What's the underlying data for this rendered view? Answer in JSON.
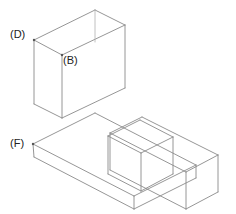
{
  "figure": {
    "background_color": "#ffffff",
    "line_color": "#8a8a8a",
    "label_color": "#222222",
    "width": 236,
    "height": 214,
    "projection": "isometric"
  },
  "labels": [
    {
      "id": "D",
      "text": "(D)",
      "x": 10,
      "y": 28,
      "vertex_x": 34,
      "vertex_y": 40
    },
    {
      "id": "B",
      "text": "(B)",
      "x": 63,
      "y": 54,
      "vertex_x": 62,
      "vertex_y": 55
    },
    {
      "id": "F",
      "text": "(F)",
      "x": 10,
      "y": 137,
      "vertex_x": 33,
      "vertex_y": 144
    }
  ],
  "geometry": {
    "upright_block": {
      "name": "vertical-upright",
      "top_face": [
        [
          34,
          40
        ],
        [
          95,
          10
        ],
        [
          125,
          25
        ],
        [
          62,
          55
        ]
      ],
      "left_face": [
        [
          34,
          40
        ],
        [
          62,
          55
        ],
        [
          62,
          117
        ],
        [
          34,
          103
        ]
      ],
      "front_face": [
        [
          62,
          55
        ],
        [
          125,
          25
        ],
        [
          125,
          88
        ],
        [
          62,
          117
        ]
      ]
    },
    "base_slab": {
      "name": "horizontal-base-plate",
      "top_face": [
        [
          33,
          144
        ],
        [
          95,
          113
        ],
        [
          196,
          165
        ],
        [
          134,
          196
        ]
      ],
      "front_left_face": [
        [
          33,
          144
        ],
        [
          34,
          156
        ],
        [
          134,
          208
        ],
        [
          134,
          196
        ]
      ],
      "right_face": [
        [
          134,
          196
        ],
        [
          196,
          165
        ],
        [
          196,
          177
        ],
        [
          134,
          208
        ]
      ]
    },
    "right_arm": {
      "name": "right-horizontal-arm",
      "top_face": [
        [
          110,
          133
        ],
        [
          142,
          117
        ],
        [
          218,
          155
        ],
        [
          186,
          172
        ]
      ],
      "front_face": [
        [
          110,
          133
        ],
        [
          110,
          170
        ],
        [
          186,
          208
        ],
        [
          186,
          172
        ]
      ],
      "end_face": [
        [
          186,
          172
        ],
        [
          218,
          155
        ],
        [
          218,
          192
        ],
        [
          186,
          208
        ]
      ]
    },
    "inner_box": {
      "name": "nested-inner-box",
      "top_face": [
        [
          108,
          135
        ],
        [
          140,
          119
        ],
        [
          173,
          136
        ],
        [
          141,
          152
        ]
      ],
      "front_face": [
        [
          108,
          135
        ],
        [
          108,
          173
        ],
        [
          141,
          190
        ],
        [
          141,
          152
        ]
      ],
      "right_face": [
        [
          141,
          152
        ],
        [
          173,
          136
        ],
        [
          173,
          173
        ],
        [
          141,
          190
        ]
      ]
    }
  },
  "edges": [
    {
      "name": "upright-top-rear-left",
      "from": [
        34,
        40
      ],
      "to": [
        95,
        10
      ],
      "weight": "normal"
    },
    {
      "name": "upright-top-rear-right",
      "from": [
        95,
        10
      ],
      "to": [
        125,
        25
      ],
      "weight": "normal"
    },
    {
      "name": "upright-top-front-right",
      "from": [
        125,
        25
      ],
      "to": [
        62,
        55
      ],
      "weight": "normal"
    },
    {
      "name": "upright-top-front-left",
      "from": [
        62,
        55
      ],
      "to": [
        34,
        40
      ],
      "weight": "normal"
    },
    {
      "name": "upright-vert-left",
      "from": [
        34,
        40
      ],
      "to": [
        34,
        104
      ],
      "weight": "normal"
    },
    {
      "name": "upright-vert-mid",
      "from": [
        62,
        55
      ],
      "to": [
        62,
        118
      ],
      "weight": "normal"
    },
    {
      "name": "upright-vert-right",
      "from": [
        125,
        25
      ],
      "to": [
        125,
        88
      ],
      "weight": "normal"
    },
    {
      "name": "upright-vert-rear",
      "from": [
        95,
        10
      ],
      "to": [
        95,
        42
      ],
      "weight": "faint"
    },
    {
      "name": "upright-base-left",
      "from": [
        34,
        104
      ],
      "to": [
        62,
        118
      ],
      "weight": "normal"
    },
    {
      "name": "upright-base-front",
      "from": [
        62,
        118
      ],
      "to": [
        125,
        88
      ],
      "weight": "normal"
    },
    {
      "name": "base-top-rear",
      "from": [
        33,
        144
      ],
      "to": [
        95,
        113
      ],
      "weight": "normal"
    },
    {
      "name": "base-rear-to-right",
      "from": [
        95,
        113
      ],
      "to": [
        196,
        165
      ],
      "weight": "normal"
    },
    {
      "name": "base-right-to-front",
      "from": [
        196,
        165
      ],
      "to": [
        134,
        196
      ],
      "weight": "normal"
    },
    {
      "name": "base-front-to-left",
      "from": [
        134,
        196
      ],
      "to": [
        33,
        144
      ],
      "weight": "normal"
    },
    {
      "name": "base-vert-left",
      "from": [
        33,
        144
      ],
      "to": [
        34,
        157
      ],
      "weight": "normal"
    },
    {
      "name": "base-vert-front",
      "from": [
        134,
        196
      ],
      "to": [
        134,
        209
      ],
      "weight": "normal"
    },
    {
      "name": "base-vert-right",
      "from": [
        196,
        165
      ],
      "to": [
        196,
        178
      ],
      "weight": "normal"
    },
    {
      "name": "base-bottom-left",
      "from": [
        34,
        157
      ],
      "to": [
        134,
        209
      ],
      "weight": "normal"
    },
    {
      "name": "base-bottom-right",
      "from": [
        134,
        209
      ],
      "to": [
        196,
        178
      ],
      "weight": "normal"
    },
    {
      "name": "arm-top-rear",
      "from": [
        110,
        133
      ],
      "to": [
        142,
        117
      ],
      "weight": "normal"
    },
    {
      "name": "arm-top-long-rear",
      "from": [
        142,
        117
      ],
      "to": [
        218,
        155
      ],
      "weight": "normal"
    },
    {
      "name": "arm-top-front-right",
      "from": [
        218,
        155
      ],
      "to": [
        186,
        172
      ],
      "weight": "normal"
    },
    {
      "name": "arm-top-long-front",
      "from": [
        186,
        172
      ],
      "to": [
        110,
        133
      ],
      "weight": "normal"
    },
    {
      "name": "arm-vert-left",
      "from": [
        110,
        133
      ],
      "to": [
        110,
        170
      ],
      "weight": "normal"
    },
    {
      "name": "arm-vert-mid",
      "from": [
        186,
        172
      ],
      "to": [
        186,
        209
      ],
      "weight": "normal"
    },
    {
      "name": "arm-vert-right",
      "from": [
        218,
        155
      ],
      "to": [
        218,
        192
      ],
      "weight": "normal"
    },
    {
      "name": "arm-bottom-long",
      "from": [
        110,
        170
      ],
      "to": [
        186,
        209
      ],
      "weight": "normal"
    },
    {
      "name": "arm-bottom-right",
      "from": [
        186,
        209
      ],
      "to": [
        218,
        192
      ],
      "weight": "normal"
    },
    {
      "name": "inner-top-rear",
      "from": [
        108,
        136
      ],
      "to": [
        140,
        120
      ],
      "weight": "normal"
    },
    {
      "name": "inner-top-right",
      "from": [
        140,
        120
      ],
      "to": [
        173,
        137
      ],
      "weight": "normal"
    },
    {
      "name": "inner-top-front-right",
      "from": [
        173,
        137
      ],
      "to": [
        141,
        153
      ],
      "weight": "normal"
    },
    {
      "name": "inner-top-front-left",
      "from": [
        141,
        153
      ],
      "to": [
        108,
        136
      ],
      "weight": "normal"
    },
    {
      "name": "inner-vert-left",
      "from": [
        108,
        136
      ],
      "to": [
        108,
        174
      ],
      "weight": "normal"
    },
    {
      "name": "inner-vert-front",
      "from": [
        141,
        153
      ],
      "to": [
        141,
        191
      ],
      "weight": "normal"
    },
    {
      "name": "inner-vert-right",
      "from": [
        173,
        137
      ],
      "to": [
        173,
        174
      ],
      "weight": "normal"
    },
    {
      "name": "inner-bottom-left",
      "from": [
        108,
        174
      ],
      "to": [
        141,
        191
      ],
      "weight": "normal"
    },
    {
      "name": "inner-bottom-right",
      "from": [
        141,
        191
      ],
      "to": [
        173,
        174
      ],
      "weight": "normal"
    }
  ]
}
